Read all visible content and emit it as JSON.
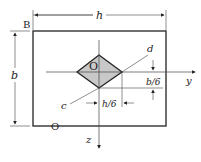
{
  "diagram": {
    "labels": {
      "corner": "B",
      "width": "h",
      "height": "b",
      "center": "O",
      "origin_below": "O",
      "diag_d": "d",
      "diag_c": "c",
      "dim_vertical": "b/6",
      "dim_horizontal": "h/6",
      "axis_y": "y",
      "axis_z": "z"
    },
    "colors": {
      "line": "#222222",
      "core_fill": "#c8c8c8",
      "background": "#ffffff"
    }
  }
}
